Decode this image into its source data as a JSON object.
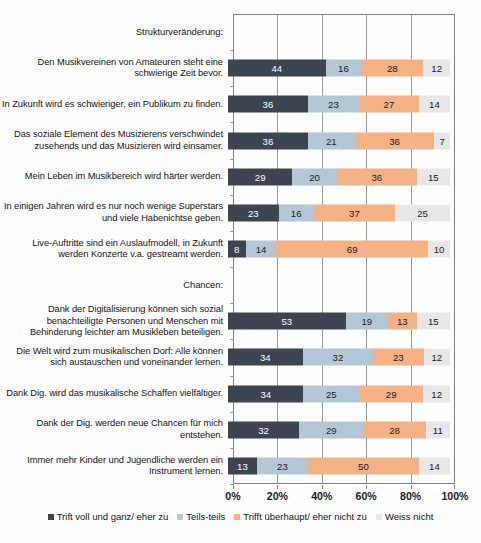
{
  "chart_data": {
    "type": "bar",
    "orientation": "horizontal",
    "stacked": true,
    "stack_unit": "percent",
    "title": "",
    "subtitle": "",
    "xlabel": "",
    "ylabel": "",
    "xlim": [
      0,
      100
    ],
    "xticks": [
      "0%",
      "20%",
      "40%",
      "60%",
      "80%",
      "100%"
    ],
    "xtick_values": [
      0,
      20,
      40,
      60,
      80,
      100
    ],
    "grid": "vertical",
    "legend_position": "bottom",
    "series": [
      {
        "name": "Trift voll und ganz/ eher zu",
        "color": "#3b444f",
        "values": [
          44,
          36,
          36,
          29,
          23,
          8,
          53,
          34,
          34,
          32,
          13
        ]
      },
      {
        "name": "Teils-teils",
        "color": "#b4c7d6",
        "values": [
          16,
          23,
          21,
          20,
          16,
          14,
          19,
          32,
          25,
          29,
          23
        ]
      },
      {
        "name": "Trifft überhaupt/ eher nicht zu",
        "color": "#f4b183",
        "values": [
          28,
          27,
          36,
          36,
          37,
          69,
          13,
          23,
          29,
          28,
          50
        ]
      },
      {
        "name": "Weiss nicht",
        "color": "#e7e7e7",
        "values": [
          12,
          14,
          7,
          15,
          25,
          10,
          15,
          12,
          12,
          11,
          14
        ]
      }
    ],
    "categories": [
      "Den Musikvereinen von Amateuren steht eine schwierige Zeit bevor.",
      "In Zukunft wird es schwieriger, ein Publikum zu finden.",
      "Das soziale Element des Musizierens verschwindet zusehends und das Musizieren wird einsamer.",
      "Mein Leben im Musikbereich wird härter werden.",
      "In einigen Jahren wird es nur noch wenige Superstars und viele Habenichtse geben.",
      "Live-Auftritte sind ein Auslaufmodell, in Zukunft werden Konzerte v.a. gestreamt werden.",
      "Dank der Digitalisierung können sich sozial benachteiligte Personen und Menschen mit Behinderung leichter am Musikleben beteiligen.",
      "Die Welt wird zum musikalischen Dorf: Alle können sich austauschen und voneinander lernen.",
      "Dank Dig. wird das musikalische Schaffen vielfältiger.",
      "Dank der Dig. werden neue Chancen für mich entstehen.",
      "Immer mehr Kinder und Jugendliche werden ein Instrument lernen."
    ],
    "section_headers": [
      {
        "label": "Strukturveränderung:",
        "before_category_index": 0
      },
      {
        "label": "Chancen:",
        "before_category_index": 6
      }
    ]
  },
  "rows": [
    {
      "kind": "section",
      "label": "Strukturveränderung:"
    },
    {
      "kind": "bar",
      "label": "Den Musikvereinen von Amateuren steht eine schwierige Zeit bevor.",
      "values": [
        44,
        16,
        28,
        12
      ]
    },
    {
      "kind": "bar",
      "label": "In Zukunft wird es schwieriger, ein Publikum zu finden.",
      "values": [
        36,
        23,
        27,
        14
      ]
    },
    {
      "kind": "bar",
      "label": "Das soziale Element des Musizierens verschwindet zusehends und das Musizieren wird einsamer.",
      "values": [
        36,
        21,
        36,
        7
      ]
    },
    {
      "kind": "bar",
      "label": "Mein Leben im Musikbereich wird härter werden.",
      "values": [
        29,
        20,
        36,
        15
      ]
    },
    {
      "kind": "bar",
      "label": "In einigen Jahren wird es nur noch wenige Superstars und viele Habenichtse geben.",
      "values": [
        23,
        16,
        37,
        25
      ]
    },
    {
      "kind": "bar",
      "label": "Live-Auftritte sind ein Auslaufmodell, in Zukunft werden Konzerte v.a. gestreamt werden.",
      "values": [
        8,
        14,
        69,
        10
      ]
    },
    {
      "kind": "section",
      "label": "Chancen:"
    },
    {
      "kind": "bar",
      "label": "Dank der Digitalisierung können sich sozial benachteiligte Personen und Menschen mit Behinderung leichter am Musikleben beteiligen.",
      "values": [
        53,
        19,
        13,
        15
      ]
    },
    {
      "kind": "bar",
      "label": "Die Welt wird zum musikalischen Dorf: Alle können sich austauschen und voneinander lernen.",
      "values": [
        34,
        32,
        23,
        12
      ]
    },
    {
      "kind": "bar",
      "label": "Dank Dig. wird das musikalische Schaffen vielfältiger.",
      "values": [
        34,
        25,
        29,
        12
      ]
    },
    {
      "kind": "bar",
      "label": "Dank der Dig. werden neue Chancen für mich entstehen.",
      "values": [
        32,
        29,
        28,
        11
      ]
    },
    {
      "kind": "bar",
      "label": "Immer mehr Kinder und Jugendliche werden ein Instrument lernen.",
      "values": [
        13,
        23,
        50,
        14
      ]
    }
  ],
  "axis": {
    "ticks": [
      "0%",
      "20%",
      "40%",
      "60%",
      "80%",
      "100%"
    ]
  },
  "legend": {
    "items": [
      {
        "label": "Trift voll und ganz/ eher zu",
        "color": "#3b444f"
      },
      {
        "label": "Teils-teils",
        "color": "#b4c7d6"
      },
      {
        "label": "Trifft überhaupt/ eher nicht zu",
        "color": "#f4b183"
      },
      {
        "label": "Weiss nicht",
        "color": "#e7e7e7"
      }
    ]
  }
}
